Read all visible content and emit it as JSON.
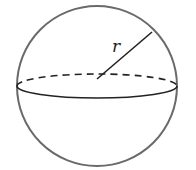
{
  "diagram": {
    "type": "sphere",
    "radius_label": "r",
    "colors": {
      "outline": "#666666",
      "stroke": "#222222",
      "background": "#ffffff"
    }
  }
}
